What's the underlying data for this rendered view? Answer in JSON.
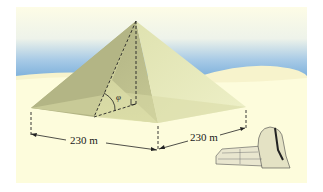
{
  "figure": {
    "labels": {
      "base_side_front_left": "230 m",
      "base_side_front_right": "230 m",
      "angle_symbol": "φ"
    },
    "colors": {
      "sand": "#fdfcdc",
      "sky_top": "#fefde8",
      "sky_blue": "#7fb3dd",
      "pyramid_left_face": "#b9b98a",
      "pyramid_front_face": "#d6d8a0",
      "pyramid_right_face": "#e3e6b6",
      "line": "#222222"
    }
  }
}
